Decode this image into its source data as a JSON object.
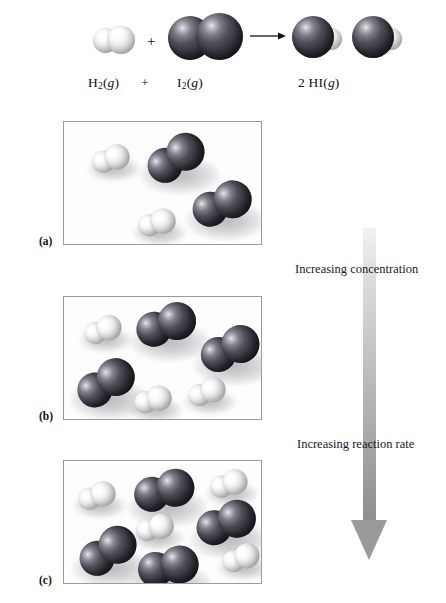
{
  "figure": {
    "type": "chemistry-illustration",
    "background_color": "#ffffff"
  },
  "equation": {
    "reactant1_label_html": "H<sub>2</sub>(<i>g</i>)",
    "reactant1_formula": "H2(g)",
    "plus1": "+",
    "plus2": "+",
    "reactant2_label_html": "I<sub>2</sub>(<i>g</i>)",
    "reactant2_formula": "I2(g)",
    "arrow_icon": "right-arrow-icon",
    "product_label_html": "2 HI(<i>g</i>)",
    "product_formula": "2 HI(g)",
    "molecules": [
      {
        "name": "H2",
        "atoms": [
          "H",
          "H"
        ]
      },
      {
        "name": "I2",
        "atoms": [
          "I",
          "I"
        ]
      },
      {
        "name": "HI",
        "atoms": [
          "I",
          "H"
        ]
      },
      {
        "name": "HI",
        "atoms": [
          "I",
          "H"
        ]
      }
    ]
  },
  "panels": [
    {
      "id": "a",
      "label": "(a)",
      "h2_count": 2,
      "i2_count": 2,
      "molecules": [
        {
          "type": "H2",
          "x": 28,
          "y": 24,
          "angle": -18,
          "scale": 1.0
        },
        {
          "type": "I2",
          "x": 82,
          "y": 16,
          "angle": -30,
          "scale": 1.0
        },
        {
          "type": "I2",
          "x": 128,
          "y": 62,
          "angle": -20,
          "scale": 1.0
        },
        {
          "type": "H2",
          "x": 74,
          "y": 88,
          "angle": -15,
          "scale": 1.0
        }
      ]
    },
    {
      "id": "b",
      "label": "(b)",
      "h2_count": 3,
      "i2_count": 3,
      "molecules": [
        {
          "type": "H2",
          "x": 20,
          "y": 20,
          "angle": -20,
          "scale": 1.0
        },
        {
          "type": "I2",
          "x": 72,
          "y": 8,
          "angle": -16,
          "scale": 1.0
        },
        {
          "type": "I2",
          "x": 136,
          "y": 32,
          "angle": -22,
          "scale": 1.0
        },
        {
          "type": "I2",
          "x": 12,
          "y": 66,
          "angle": -28,
          "scale": 1.0
        },
        {
          "type": "H2",
          "x": 70,
          "y": 90,
          "angle": -14,
          "scale": 1.0
        },
        {
          "type": "H2",
          "x": 124,
          "y": 82,
          "angle": -20,
          "scale": 1.0
        }
      ]
    },
    {
      "id": "c",
      "label": "(c)",
      "h2_count": 4,
      "i2_count": 4,
      "molecules": [
        {
          "type": "H2",
          "x": 14,
          "y": 22,
          "angle": -18,
          "scale": 1.0
        },
        {
          "type": "I2",
          "x": 70,
          "y": 10,
          "angle": -12,
          "scale": 1.0
        },
        {
          "type": "H2",
          "x": 146,
          "y": 10,
          "angle": -18,
          "scale": 1.0
        },
        {
          "type": "I2",
          "x": 132,
          "y": 42,
          "angle": -18,
          "scale": 1.0
        },
        {
          "type": "H2",
          "x": 72,
          "y": 54,
          "angle": -14,
          "scale": 1.0
        },
        {
          "type": "I2",
          "x": 14,
          "y": 70,
          "angle": -30,
          "scale": 1.0
        },
        {
          "type": "I2",
          "x": 74,
          "y": 86,
          "angle": -8,
          "scale": 1.0
        },
        {
          "type": "H2",
          "x": 158,
          "y": 84,
          "angle": -20,
          "scale": 1.0
        }
      ]
    }
  ],
  "annotations": {
    "top_text": "Increasing concentration",
    "bottom_text": "Increasing reaction rate",
    "arrow_icon": "down-arrow-icon",
    "arrow_direction": "down",
    "arrow_color_top": "#e6e6e6",
    "arrow_color_bottom": "#8f8f8f"
  },
  "colors": {
    "hydrogen_atom": "#f2f2f2",
    "iodine_atom": "#35353f",
    "panel_border": "#9b9b9b",
    "text": "#111111"
  }
}
